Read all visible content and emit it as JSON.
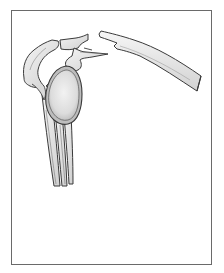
{
  "figure": {
    "parts": [
      {
        "name": "acromion",
        "label": ""
      },
      {
        "name": "coracoid-process",
        "label": ""
      },
      {
        "name": "glenoid-fossa",
        "label": ""
      },
      {
        "name": "scapular-body",
        "label": ""
      },
      {
        "name": "clavicle-distal-fragment",
        "label": ""
      },
      {
        "name": "clavicle-shaft",
        "label": ""
      }
    ],
    "colors": {
      "frame": "#6a6a6a",
      "bone_fill": "#e9e9e9",
      "bone_outline": "#3a3a3a",
      "shading": "#9a9a9a",
      "background": "#ffffff"
    }
  }
}
